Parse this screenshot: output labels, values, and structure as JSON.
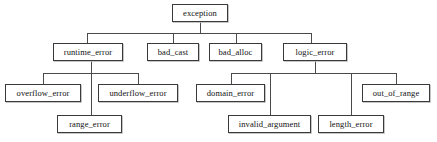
{
  "diagram": {
    "type": "tree",
    "width": 437,
    "height": 142,
    "background": "#ffffff",
    "box_border_color": "#3a3a3a",
    "box_fill_color": "#ffffff",
    "line_color": "#4a4a4a",
    "text_color": "#111111",
    "root": "exception",
    "nodes": [
      {
        "id": "exception",
        "label": "exception",
        "x": 172,
        "y": 4,
        "w": 56,
        "h": 18,
        "level": 0
      },
      {
        "id": "runtime_error",
        "label": "runtime_error",
        "x": 53,
        "y": 43,
        "w": 70,
        "h": 18,
        "level": 1
      },
      {
        "id": "bad_cast",
        "label": "bad_cast",
        "x": 147,
        "y": 43,
        "w": 52,
        "h": 18,
        "level": 1
      },
      {
        "id": "bad_alloc",
        "label": "bad_alloc",
        "x": 209,
        "y": 43,
        "w": 53,
        "h": 18,
        "level": 1
      },
      {
        "id": "logic_error",
        "label": "logic_error",
        "x": 283,
        "y": 43,
        "w": 64,
        "h": 18,
        "level": 1
      },
      {
        "id": "overflow_error",
        "label": "overflow_error",
        "x": 5,
        "y": 84,
        "w": 76,
        "h": 18,
        "level": 2
      },
      {
        "id": "underflow_error",
        "label": "underflow_error",
        "x": 98,
        "y": 84,
        "w": 80,
        "h": 18,
        "level": 2
      },
      {
        "id": "domain_error",
        "label": "domain_error",
        "x": 196,
        "y": 84,
        "w": 69,
        "h": 18,
        "level": 2
      },
      {
        "id": "out_of_range",
        "label": "out_of_range",
        "x": 362,
        "y": 84,
        "w": 68,
        "h": 18,
        "level": 2
      },
      {
        "id": "range_error",
        "label": "range_error",
        "x": 57,
        "y": 115,
        "w": 65,
        "h": 18,
        "level": 3
      },
      {
        "id": "invalid_argument",
        "label": "invalid_argument",
        "x": 228,
        "y": 115,
        "w": 83,
        "h": 18,
        "level": 3
      },
      {
        "id": "length_error",
        "label": "length_error",
        "x": 318,
        "y": 115,
        "w": 66,
        "h": 18,
        "level": 3
      }
    ],
    "edges": [
      {
        "id": "e-exception-stem",
        "from": "exception",
        "to": "bus-root",
        "orient": "v",
        "x": 200,
        "y": 22,
        "len": 11
      },
      {
        "id": "e-root-bus",
        "from": "bus-root",
        "to": "level1",
        "orient": "h",
        "x": 87,
        "y": 33,
        "len": 225
      },
      {
        "id": "e-drop-runtime_error",
        "from": "bus-root",
        "to": "runtime_error",
        "orient": "v",
        "x": 87,
        "y": 33,
        "len": 10
      },
      {
        "id": "e-drop-bad_cast",
        "from": "bus-root",
        "to": "bad_cast",
        "orient": "v",
        "x": 173,
        "y": 33,
        "len": 10
      },
      {
        "id": "e-drop-bad_alloc",
        "from": "bus-root",
        "to": "bad_alloc",
        "orient": "v",
        "x": 236,
        "y": 33,
        "len": 10
      },
      {
        "id": "e-drop-logic_error",
        "from": "bus-root",
        "to": "logic_error",
        "orient": "v",
        "x": 311,
        "y": 33,
        "len": 10
      },
      {
        "id": "e-runtime-stem",
        "from": "runtime_error",
        "to": "bus-runtime",
        "orient": "v",
        "x": 91,
        "y": 61,
        "len": 12
      },
      {
        "id": "e-runtime-bus",
        "from": "bus-runtime",
        "to": "runtime-children",
        "orient": "h",
        "x": 43,
        "y": 73,
        "len": 96
      },
      {
        "id": "e-drop-overflow_error",
        "from": "bus-runtime",
        "to": "overflow_error",
        "orient": "v",
        "x": 43,
        "y": 73,
        "len": 11
      },
      {
        "id": "e-drop-underflow_error",
        "from": "bus-runtime",
        "to": "underflow_error",
        "orient": "v",
        "x": 138,
        "y": 73,
        "len": 11
      },
      {
        "id": "e-drop-range_error",
        "from": "bus-runtime",
        "to": "range_error",
        "orient": "v",
        "x": 91,
        "y": 73,
        "len": 42
      },
      {
        "id": "e-logic-stem",
        "from": "logic_error",
        "to": "bus-logic",
        "orient": "v",
        "x": 315,
        "y": 61,
        "len": 12
      },
      {
        "id": "e-logic-bus",
        "from": "bus-logic",
        "to": "logic-children",
        "orient": "h",
        "x": 231,
        "y": 73,
        "len": 165
      },
      {
        "id": "e-drop-domain_error",
        "from": "bus-logic",
        "to": "domain_error",
        "orient": "v",
        "x": 231,
        "y": 73,
        "len": 11
      },
      {
        "id": "e-drop-out_of_range",
        "from": "bus-logic",
        "to": "out_of_range",
        "orient": "v",
        "x": 396,
        "y": 73,
        "len": 11
      },
      {
        "id": "e-drop-invalid_argument",
        "from": "bus-logic",
        "to": "invalid_argument",
        "orient": "v",
        "x": 270,
        "y": 73,
        "len": 42
      },
      {
        "id": "e-drop-length_error",
        "from": "bus-logic",
        "to": "length_error",
        "orient": "v",
        "x": 351,
        "y": 73,
        "len": 42
      }
    ]
  }
}
